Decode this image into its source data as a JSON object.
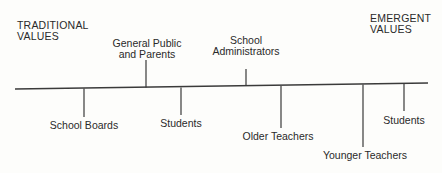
{
  "diagram": {
    "type": "continuum",
    "left_pole": {
      "line1": "TRADITIONAL",
      "line2": "VALUES"
    },
    "right_pole": {
      "line1": "EMERGENT",
      "line2": "VALUES"
    },
    "axis": {
      "x1": 15,
      "y1": 89,
      "x2": 428,
      "y2": 83,
      "color": "#3a3a3a"
    },
    "markers": [
      {
        "id": "school-boards",
        "label": "School Boards",
        "x": 84,
        "direction": "down",
        "length": 28
      },
      {
        "id": "general-public",
        "label_line1": "General Public",
        "label_line2": "and Parents",
        "x": 146,
        "direction": "up",
        "length": 27
      },
      {
        "id": "students-1",
        "label": "Students",
        "x": 181,
        "direction": "down",
        "length": 27
      },
      {
        "id": "school-admin",
        "label_line1": "School",
        "label_line2": "Administrators",
        "x": 246,
        "direction": "up",
        "length": 17
      },
      {
        "id": "older-teachers",
        "label": "Older Teachers",
        "x": 281,
        "direction": "down",
        "length": 41
      },
      {
        "id": "younger-teachers",
        "label": "Younger Teachers",
        "x": 363,
        "direction": "down",
        "length": 62
      },
      {
        "id": "students-2",
        "label": "Students",
        "x": 404,
        "direction": "down",
        "length": 26
      }
    ]
  }
}
